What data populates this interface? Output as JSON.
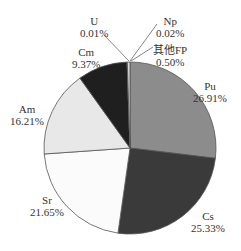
{
  "chart_data": {
    "type": "pie",
    "title": "",
    "start_angle_deg": 0,
    "direction": "clockwise",
    "center": [
      130,
      148
    ],
    "radius": 86,
    "slices": [
      {
        "name": "Pu",
        "value": 26.91,
        "label": "26.91%",
        "color": "#8c8c8c"
      },
      {
        "name": "Cs",
        "value": 25.33,
        "label": "25.33%",
        "color": "#3a3a3a"
      },
      {
        "name": "Sr",
        "value": 21.65,
        "label": "21.65%",
        "color": "#fbfbfb"
      },
      {
        "name": "Am",
        "value": 16.21,
        "label": "16.21%",
        "color": "#e8e8e8"
      },
      {
        "name": "Cm",
        "value": 9.37,
        "label": "9.37%",
        "color": "#1f1f1f"
      },
      {
        "name": "U",
        "value": 0.01,
        "label": "0.01%",
        "color": "#cccccc"
      },
      {
        "name": "Np",
        "value": 0.02,
        "label": "0.02%",
        "color": "#bbbbbb"
      },
      {
        "name": "其他FP",
        "value": 0.5,
        "label": "0.50%",
        "color": "#d8d8d8"
      }
    ],
    "labels": [
      {
        "name": "Pu",
        "pct": "26.91%",
        "x": 210,
        "y": 80
      },
      {
        "name": "Cs",
        "pct": "25.33%",
        "x": 208,
        "y": 210
      },
      {
        "name": "Sr",
        "pct": "21.65%",
        "x": 47,
        "y": 194
      },
      {
        "name": "Am",
        "pct": "16.21%",
        "x": 27,
        "y": 103
      },
      {
        "name": "Cm",
        "pct": "9.37%",
        "x": 86,
        "y": 46
      },
      {
        "name": "U",
        "pct": "0.01%",
        "x": 94,
        "y": 15
      },
      {
        "name": "Np",
        "pct": "0.02%",
        "x": 170,
        "y": 15
      },
      {
        "name": "其他FP",
        "pct": "0.50%",
        "x": 170,
        "y": 44
      }
    ],
    "leaders": [
      {
        "name": "U",
        "from": [
          104,
          35
        ],
        "to": [
          129,
          61
        ]
      },
      {
        "name": "Np",
        "from": [
          157,
          24
        ],
        "to": [
          130,
          61
        ]
      },
      {
        "name": "其他FP",
        "from": [
          153,
          47
        ],
        "to": [
          131,
          61
        ]
      }
    ],
    "legend": null
  }
}
